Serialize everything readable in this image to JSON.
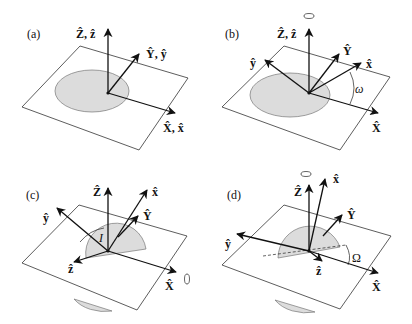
{
  "figure": {
    "panels": [
      {
        "id": "a",
        "tag": "(a)",
        "labels": {
          "z": "Ẑ, ẑ",
          "y": "Ŷ, ŷ",
          "x": "X̂, x̂"
        }
      },
      {
        "id": "b",
        "tag": "(b)",
        "labels": {
          "z": "Ẑ, ẑ",
          "Y": "Ŷ",
          "y": "ŷ",
          "x": "x̂",
          "X": "X̂",
          "angle": "ω"
        },
        "rotation_axis": "Z"
      },
      {
        "id": "c",
        "tag": "(c)",
        "labels": {
          "Z": "Ẑ",
          "x": "x̂",
          "Y": "Ŷ",
          "y": "ŷ",
          "z": "ẑ",
          "X": "X̂",
          "angle": "I"
        },
        "rotation_axis": "X"
      },
      {
        "id": "d",
        "tag": "(d)",
        "labels": {
          "Z": "Ẑ",
          "x": "x̂",
          "Y": "Ŷ",
          "y": "ŷ",
          "z": "ẑ",
          "X": "X̂",
          "angle": "Ω"
        },
        "rotation_axis": "Z"
      }
    ]
  },
  "colors": {
    "line": "#111111",
    "disc_fill": "#dcdcdc",
    "plane_stroke": "#333333",
    "background": "#ffffff"
  }
}
